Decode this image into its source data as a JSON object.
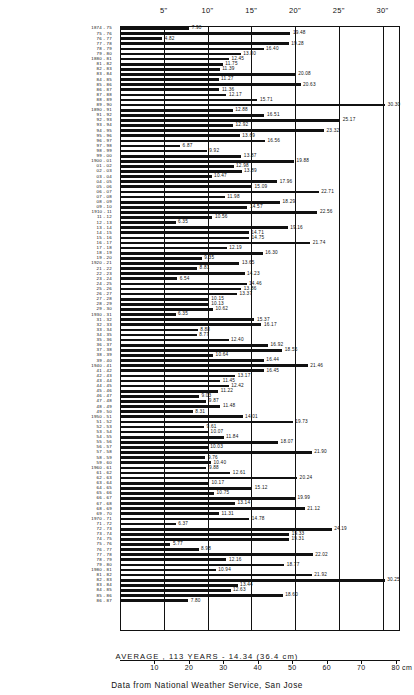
{
  "chart_data": {
    "type": "bar",
    "orientation": "horizontal",
    "title": "",
    "xlabel": "inches",
    "ylabel": "season",
    "xlim": [
      0,
      32
    ],
    "grid": true,
    "legend": null,
    "top_axis": {
      "unit": "inches",
      "ticks": [
        5,
        10,
        15,
        20,
        25,
        30
      ],
      "tick_labels": [
        "5\"",
        "10\"",
        "15\"",
        "20\"",
        "25\"",
        "30\""
      ]
    },
    "bottom_axis": {
      "unit": "cm",
      "ticks": [
        10,
        20,
        30,
        40,
        50,
        60,
        70,
        80
      ],
      "tick_labels": [
        "10",
        "20",
        "30",
        "40",
        "50",
        "60",
        "70",
        "80 cm"
      ]
    },
    "annotations": {
      "average": "AVERAGE , 113 YEARS  -  14.34  (36.4 cm)",
      "source": "Data from National Weather Service, San Jose"
    },
    "categories": [
      "1874 - 75",
      "75 - 76",
      "76 - 77",
      "77 - 78",
      "78 - 79",
      "79 - 80",
      "1880 - 81",
      "81 - 82",
      "82 - 83",
      "83 - 84",
      "84 - 85",
      "85 - 86",
      "86 - 87",
      "87 - 88",
      "88 - 89",
      "89 - 90",
      "1890 - 91",
      "91 - 92",
      "92 - 93",
      "93 - 94",
      "94 - 95",
      "95 - 96",
      "96 - 97",
      "97 - 98",
      "98 - 99",
      "99 - 00",
      "1900 - 01",
      "01 - 02",
      "02 - 03",
      "03 - 04",
      "04 - 05",
      "05 - 06",
      "06 - 07",
      "07 - 08",
      "08 - 09",
      "09 - 10",
      "1910 - 11",
      "11 - 12",
      "12 - 13",
      "13 - 14",
      "14 - 15",
      "15 - 16",
      "16 - 17",
      "17 - 18",
      "18 - 19",
      "19 - 20",
      "1920 - 21",
      "21 - 22",
      "22 - 23",
      "23 - 24",
      "24 - 25",
      "25 - 26",
      "26 - 27",
      "27 - 28",
      "28 - 29",
      "29 - 30",
      "1930 - 31",
      "31 - 32",
      "32 - 33",
      "33 - 34",
      "34 - 35",
      "35 - 36",
      "36 - 37",
      "37 - 38",
      "38 - 39",
      "39 - 40",
      "1940 - 41",
      "41 - 42",
      "42 - 43",
      "43 - 44",
      "44 - 45",
      "45 - 46",
      "46 - 47",
      "47 - 48",
      "48 - 49",
      "49 - 50",
      "1950 - 51",
      "51 - 52",
      "52 - 53",
      "53 - 54",
      "54 - 55",
      "55 - 56",
      "56 - 57",
      "57 - 58",
      "58 - 59",
      "59 - 60",
      "1960 - 61",
      "61 - 62",
      "62 - 63",
      "63 - 64",
      "64 - 65",
      "65 - 66",
      "66 - 67",
      "67 - 68",
      "68 - 69",
      "69 - 70",
      "1970 - 71",
      "71 - 72",
      "72 - 73",
      "73 - 74",
      "74 - 75",
      "75 - 76",
      "76 - 77",
      "77 - 78",
      "78 - 79",
      "79 - 80",
      "1980 - 81",
      "81 - 82",
      "82 - 83",
      "83 - 84",
      "84 - 85",
      "85 - 86",
      "86 - 87"
    ],
    "values": [
      7.9,
      19.48,
      4.82,
      19.28,
      16.4,
      13.8,
      12.45,
      11.75,
      11.39,
      20.08,
      11.27,
      20.63,
      11.36,
      12.17,
      15.71,
      30.3,
      12.88,
      16.51,
      25.17,
      12.92,
      23.32,
      13.69,
      16.56,
      6.87,
      9.92,
      13.87,
      19.88,
      12.98,
      13.89,
      10.47,
      17.96,
      15.09,
      22.71,
      11.98,
      18.29,
      14.57,
      22.56,
      10.56,
      6.35,
      19.16,
      14.71,
      14.75,
      21.74,
      12.19,
      16.3,
      9.35,
      13.65,
      8.81,
      14.23,
      6.54,
      14.46,
      13.86,
      13.37,
      10.15,
      10.13,
      10.62,
      6.35,
      15.37,
      16.17,
      8.88,
      8.77,
      12.4,
      16.92,
      18.55,
      10.64,
      16.44,
      21.46,
      16.45,
      13.17,
      11.45,
      12.42,
      11.22,
      9.03,
      9.87,
      11.48,
      8.31,
      14.01,
      19.73,
      9.61,
      10.07,
      11.84,
      18.07,
      10.03,
      21.9,
      9.76,
      10.4,
      9.88,
      12.61,
      20.24,
      10.17,
      15.12,
      10.75,
      19.99,
      13.14,
      21.12,
      11.31,
      14.78,
      6.37,
      24.19,
      19.33,
      19.31,
      5.77,
      8.98,
      22.02,
      12.16,
      18.77,
      10.94,
      21.92,
      30.25,
      13.44,
      12.63,
      18.6,
      7.8
    ]
  }
}
